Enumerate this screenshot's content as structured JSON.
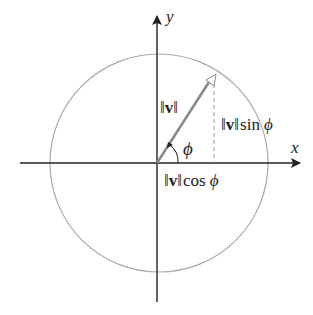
{
  "diagram": {
    "axes": {
      "x_label": "x",
      "y_label": "y"
    },
    "labels": {
      "norm_left": "‖",
      "norm_v": "v",
      "norm_right": "‖",
      "sin_text": "sin",
      "cos_text": "cos",
      "phi": "ϕ"
    },
    "colors": {
      "axis": "#222222",
      "circle": "#a8a8a8",
      "vector": "#8a8a8a",
      "dashed": "#9a9a9a",
      "text": "#222222"
    }
  }
}
